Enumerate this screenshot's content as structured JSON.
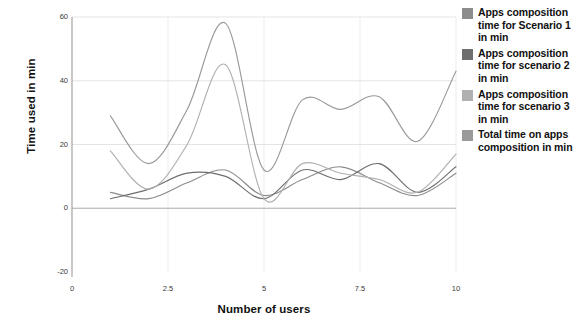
{
  "chart_data": {
    "type": "line",
    "title": "",
    "xlabel": "Number of users",
    "ylabel": "Time used in min",
    "xlim": [
      0,
      10
    ],
    "ylim": [
      -20,
      60
    ],
    "xticks": [
      "0",
      "2.5",
      "5",
      "7.5",
      "10"
    ],
    "xtick_values": [
      0,
      2.5,
      5,
      7.5,
      10
    ],
    "yticks": [
      "60",
      "40",
      "20",
      "0",
      "-20"
    ],
    "ytick_values": [
      60,
      40,
      20,
      0,
      -20
    ],
    "grid": true,
    "legend_position": "right",
    "x": [
      1,
      2,
      3,
      4,
      5,
      6,
      7,
      8,
      9,
      10
    ],
    "series": [
      {
        "name": "Apps composition time for Scenario 1 in min",
        "color": "#8c8c8c",
        "values": [
          5,
          3,
          8,
          12,
          4,
          9,
          13,
          8,
          4,
          11
        ]
      },
      {
        "name": "Apps composition time for scenario 2 in min",
        "color": "#6e6e6e",
        "values": [
          3,
          6,
          11,
          10,
          3,
          12,
          9,
          14,
          5,
          13
        ]
      },
      {
        "name": "Apps composition time for scenario 3 in min",
        "color": "#b0b0b0",
        "values": [
          18,
          6,
          20,
          45,
          3,
          14,
          11,
          9,
          5,
          17
        ]
      },
      {
        "name": "Total time on apps composition in min",
        "color": "#9a9a9a",
        "values": [
          29,
          14,
          31,
          58,
          12,
          34,
          31,
          35,
          21,
          43
        ]
      }
    ]
  },
  "legend": {
    "items": [
      {
        "label": "Apps composition time for Scenario 1 in min",
        "color": "#8c8c8c"
      },
      {
        "label": "Apps composition time for scenario 2 in min",
        "color": "#6e6e6e"
      },
      {
        "label": "Apps composition time for scenario 3 in min",
        "color": "#b0b0b0"
      },
      {
        "label": "Total time on apps composition in min",
        "color": "#9a9a9a"
      }
    ]
  }
}
